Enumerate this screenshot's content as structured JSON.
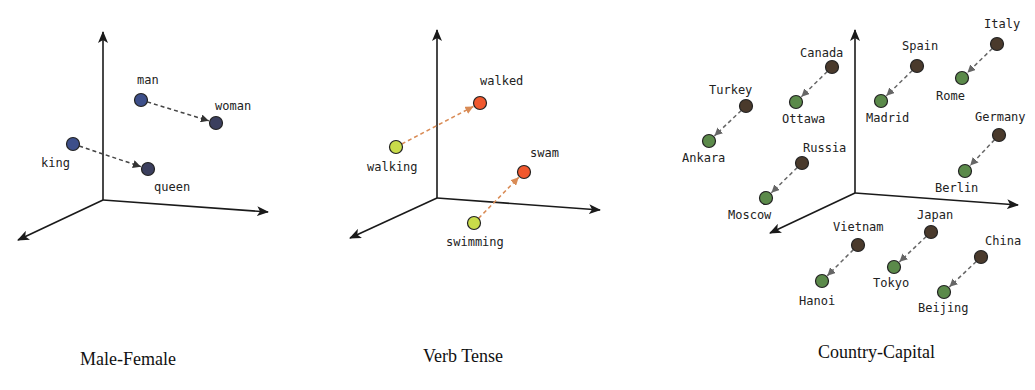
{
  "colors": {
    "axis": "#1a1a1a",
    "male_female_dot": "#3d4f8a",
    "male_female_dot_target": "#3b3f5e",
    "male_female_arrow": "#444444",
    "verb_base": "#c9dc4a",
    "verb_past": "#f0582e",
    "verb_arrow": "#d98b55",
    "country": "#4a3a2c",
    "capital": "#5b8a4a",
    "country_arrow": "#666666"
  },
  "panels": [
    {
      "caption": "Male-Female",
      "axes": {
        "origin": [
          103,
          200
        ],
        "up": [
          103,
          32
        ],
        "right": [
          268,
          212
        ],
        "left": [
          18,
          240
        ]
      },
      "pairs": [
        {
          "from": {
            "label": "man",
            "x": 141,
            "y": 100,
            "lx": 137,
            "ly": 84
          },
          "to": {
            "label": "woman",
            "x": 216,
            "y": 123,
            "lx": 215,
            "ly": 110
          }
        },
        {
          "from": {
            "label": "king",
            "x": 73,
            "y": 144,
            "lx": 41,
            "ly": 167
          },
          "to": {
            "label": "queen",
            "x": 148,
            "y": 169,
            "lx": 154,
            "ly": 191
          }
        }
      ]
    },
    {
      "caption": "Verb Tense",
      "axes": {
        "origin": [
          437,
          198
        ],
        "up": [
          437,
          30
        ],
        "right": [
          600,
          210
        ],
        "left": [
          350,
          238
        ]
      },
      "pairs": [
        {
          "from": {
            "label": "walking",
            "x": 396,
            "y": 147,
            "lx": 367,
            "ly": 171
          },
          "to": {
            "label": "walked",
            "x": 480,
            "y": 103,
            "lx": 480,
            "ly": 85
          }
        },
        {
          "from": {
            "label": "swimming",
            "x": 474,
            "y": 223,
            "lx": 446,
            "ly": 246
          },
          "to": {
            "label": "swam",
            "x": 524,
            "y": 172,
            "lx": 530,
            "ly": 157
          }
        }
      ]
    },
    {
      "caption": "Country-Capital",
      "axes": {
        "origin": [
          855,
          193
        ],
        "up": [
          855,
          30
        ],
        "right": [
          1018,
          205
        ],
        "left": [
          770,
          233
        ]
      },
      "pairs": [
        {
          "from": {
            "label": "Canada",
            "x": 832,
            "y": 67,
            "lx": 800,
            "ly": 57
          },
          "to": {
            "label": "Ottawa",
            "x": 796,
            "y": 102,
            "lx": 782,
            "ly": 123
          }
        },
        {
          "from": {
            "label": "Turkey",
            "x": 746,
            "y": 106,
            "lx": 709,
            "ly": 94
          },
          "to": {
            "label": "Ankara",
            "x": 709,
            "y": 141,
            "lx": 682,
            "ly": 162
          }
        },
        {
          "from": {
            "label": "Spain",
            "x": 917,
            "y": 66,
            "lx": 902,
            "ly": 50
          },
          "to": {
            "label": "Madrid",
            "x": 881,
            "y": 101,
            "lx": 866,
            "ly": 122
          }
        },
        {
          "from": {
            "label": "Italy",
            "x": 997,
            "y": 44,
            "lx": 984,
            "ly": 28
          },
          "to": {
            "label": "Rome",
            "x": 962,
            "y": 78,
            "lx": 936,
            "ly": 100
          }
        },
        {
          "from": {
            "label": "Russia",
            "x": 802,
            "y": 163,
            "lx": 803,
            "ly": 152
          },
          "to": {
            "label": "Moscow",
            "x": 766,
            "y": 198,
            "lx": 728,
            "ly": 219
          }
        },
        {
          "from": {
            "label": "Germany",
            "x": 999,
            "y": 135,
            "lx": 975,
            "ly": 121
          },
          "to": {
            "label": "Berlin",
            "x": 965,
            "y": 171,
            "lx": 935,
            "ly": 192
          }
        },
        {
          "from": {
            "label": "Vietnam",
            "x": 858,
            "y": 245,
            "lx": 833,
            "ly": 231
          },
          "to": {
            "label": "Hanoi",
            "x": 822,
            "y": 281,
            "lx": 799,
            "ly": 305
          }
        },
        {
          "from": {
            "label": "Japan",
            "x": 931,
            "y": 232,
            "lx": 917,
            "ly": 219
          },
          "to": {
            "label": "Tokyo",
            "x": 894,
            "y": 267,
            "lx": 873,
            "ly": 287
          }
        },
        {
          "from": {
            "label": "China",
            "x": 981,
            "y": 257,
            "lx": 985,
            "ly": 245
          },
          "to": {
            "label": "Beijing",
            "x": 944,
            "y": 292,
            "lx": 918,
            "ly": 312
          }
        }
      ]
    }
  ],
  "captions": [
    {
      "text": "Male-Female",
      "x": 80,
      "y": 365
    },
    {
      "text": "Verb Tense",
      "x": 423,
      "y": 362
    },
    {
      "text": "Country-Capital",
      "x": 818,
      "y": 358
    }
  ]
}
